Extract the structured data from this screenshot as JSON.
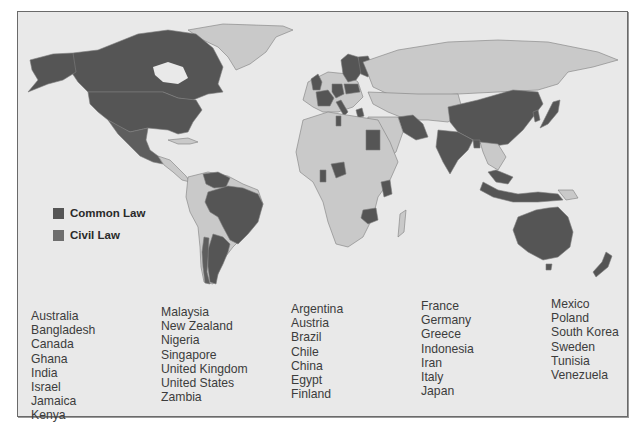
{
  "colors": {
    "background": "#e9e9e9",
    "land_default": "#c9c9c9",
    "common_law": "#555555",
    "civil_law": "#6a6a6a",
    "border": "#7d7d7d",
    "frame": "#6a6a6a"
  },
  "legend": {
    "items": [
      {
        "label": "Common Law",
        "color": "#555555"
      },
      {
        "label": "Civil Law",
        "color": "#6e6e6e"
      }
    ]
  },
  "country_lists": {
    "common_law": {
      "column_1": [
        "Australia",
        "Bangladesh",
        "Canada",
        "Ghana",
        "India",
        "Israel",
        "Jamaica",
        "Kenya"
      ],
      "column_2": [
        "Malaysia",
        "New Zealand",
        "Nigeria",
        "Singapore",
        "United Kingdom",
        "United States",
        "Zambia"
      ]
    },
    "civil_law": {
      "column_3": [
        "Argentina",
        "Austria",
        "Brazil",
        "Chile",
        "China",
        "Egypt",
        "Finland"
      ],
      "column_4": [
        "France",
        "Germany",
        "Greece",
        "Indonesia",
        "Iran",
        "Italy",
        "Japan"
      ],
      "column_5": [
        "Mexico",
        "Poland",
        "South Korea",
        "Sweden",
        "Tunisia",
        "Venezuela"
      ]
    }
  },
  "columns": [
    {
      "items": [
        "Australia",
        "Bangladesh",
        "Canada",
        "Ghana",
        "India",
        "Israel",
        "Jamaica",
        "Kenya"
      ]
    },
    {
      "items": [
        "Malaysia",
        "New Zealand",
        "Nigeria",
        "Singapore",
        "United Kingdom",
        "United States",
        "Zambia"
      ]
    },
    {
      "items": [
        "Argentina",
        "Austria",
        "Brazil",
        "Chile",
        "China",
        "Egypt",
        "Finland"
      ]
    },
    {
      "items": [
        "France",
        "Germany",
        "Greece",
        "Indonesia",
        "Iran",
        "Italy",
        "Japan"
      ]
    },
    {
      "items": [
        "Mexico",
        "Poland",
        "South Korea",
        "Sweden",
        "Tunisia",
        "Venezuela"
      ]
    }
  ]
}
